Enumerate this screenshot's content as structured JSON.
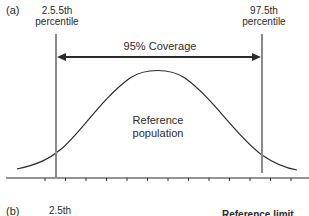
{
  "panel_a": {
    "label": "(a)",
    "left_limit": {
      "line1": "2.5.5th",
      "line2": "percentile"
    },
    "right_limit": {
      "line1": "97.5th",
      "line2": "percentile"
    },
    "coverage_label": "95% Coverage",
    "curve_label": {
      "line1": "Reference",
      "line2": "population"
    }
  },
  "panel_b": {
    "label": "(b)",
    "left_limit": {
      "line1": "2.5th"
    },
    "right_text": "Reference limit"
  },
  "colors": {
    "line": "#2a2a2a",
    "limit_line": "#8a8a8a"
  }
}
